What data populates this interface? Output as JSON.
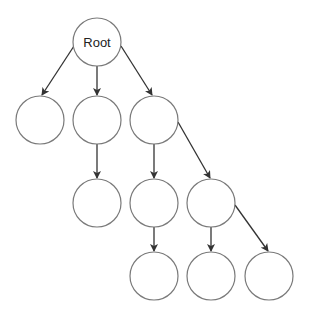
{
  "diagram": {
    "type": "tree",
    "colors": {
      "node_fill": "#ffffff",
      "node_stroke": "#7a7a7a",
      "edge": "#333333",
      "label": "#222222"
    },
    "nodes": [
      {
        "id": "root",
        "label": "Root",
        "cx": 97,
        "cy": 42,
        "r": 24
      },
      {
        "id": "n1",
        "label": "",
        "cx": 40,
        "cy": 120,
        "r": 24
      },
      {
        "id": "n2",
        "label": "",
        "cx": 97,
        "cy": 120,
        "r": 24
      },
      {
        "id": "n3",
        "label": "",
        "cx": 154,
        "cy": 120,
        "r": 24
      },
      {
        "id": "n4",
        "label": "",
        "cx": 97,
        "cy": 203,
        "r": 24
      },
      {
        "id": "n5",
        "label": "",
        "cx": 154,
        "cy": 203,
        "r": 24
      },
      {
        "id": "n6",
        "label": "",
        "cx": 211,
        "cy": 203,
        "r": 24
      },
      {
        "id": "n7",
        "label": "",
        "cx": 154,
        "cy": 276,
        "r": 24
      },
      {
        "id": "n8",
        "label": "",
        "cx": 211,
        "cy": 276,
        "r": 24
      },
      {
        "id": "n9",
        "label": "",
        "cx": 269,
        "cy": 276,
        "r": 24
      }
    ],
    "edges": [
      {
        "from": "root",
        "to": "n1",
        "x1": 74,
        "y1": 46,
        "x2": 42,
        "y2": 95
      },
      {
        "from": "root",
        "to": "n2",
        "x1": 97,
        "y1": 66,
        "x2": 97,
        "y2": 95
      },
      {
        "from": "root",
        "to": "n3",
        "x1": 121,
        "y1": 46,
        "x2": 152,
        "y2": 95
      },
      {
        "from": "n2",
        "to": "n4",
        "x1": 97,
        "y1": 144,
        "x2": 97,
        "y2": 178
      },
      {
        "from": "n3",
        "to": "n5",
        "x1": 154,
        "y1": 144,
        "x2": 154,
        "y2": 178
      },
      {
        "from": "n3",
        "to": "n6",
        "x1": 178,
        "y1": 122,
        "x2": 210,
        "y2": 178
      },
      {
        "from": "n5",
        "to": "n7",
        "x1": 154,
        "y1": 227,
        "x2": 154,
        "y2": 251
      },
      {
        "from": "n6",
        "to": "n8",
        "x1": 211,
        "y1": 227,
        "x2": 211,
        "y2": 251
      },
      {
        "from": "n6",
        "to": "n9",
        "x1": 235,
        "y1": 205,
        "x2": 268,
        "y2": 251
      }
    ]
  }
}
